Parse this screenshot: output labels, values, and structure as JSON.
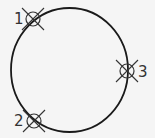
{
  "diagram": {
    "title": "",
    "main_circle": {
      "cx": 69.5,
      "cy": 70,
      "rx": 58.5,
      "ry": 62
    },
    "stroke_color": "#1a1a1a",
    "markers": [
      {
        "id": "1",
        "label": "1",
        "cx": 33,
        "cy": 19,
        "label_x": 14,
        "label_y": 24
      },
      {
        "id": "2",
        "label": "2",
        "cx": 34,
        "cy": 121,
        "label_x": 14,
        "label_y": 126
      },
      {
        "id": "3",
        "label": "3",
        "cx": 127,
        "cy": 71,
        "label_x": 138,
        "label_y": 77
      }
    ]
  }
}
